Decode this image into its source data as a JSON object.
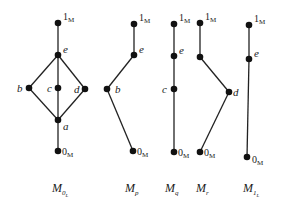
{
  "diagrams": [
    {
      "id": "M0L",
      "caption": "M",
      "caption_sub": "0",
      "caption_subsub": "L",
      "caption_pos": [
        52,
        192
      ],
      "nodes": [
        {
          "id": "1",
          "label": "1",
          "sub": "M",
          "x": 58,
          "y": 23,
          "lx": 63,
          "ly": 20,
          "kind": "bm"
        },
        {
          "id": "e",
          "label": "e",
          "x": 58,
          "y": 55,
          "lx": 63,
          "ly": 53,
          "kind": "lbl"
        },
        {
          "id": "b",
          "label": "b",
          "x": 29,
          "y": 88,
          "lx": 17,
          "ly": 92,
          "kind": "lbl"
        },
        {
          "id": "c",
          "label": "c",
          "x": 58,
          "y": 88,
          "lx": 47,
          "ly": 92,
          "kind": "lbl"
        },
        {
          "id": "d",
          "label": "d",
          "x": 85,
          "y": 89,
          "lx": 74,
          "ly": 93,
          "kind": "lbl"
        },
        {
          "id": "a",
          "label": "a",
          "x": 58,
          "y": 120,
          "lx": 63,
          "ly": 130,
          "kind": "lbl"
        },
        {
          "id": "0",
          "label": "0",
          "sub": "M",
          "x": 58,
          "y": 151,
          "lx": 62,
          "ly": 155,
          "kind": "bm"
        }
      ],
      "edges": [
        [
          "1",
          "e"
        ],
        [
          "e",
          "b"
        ],
        [
          "e",
          "c"
        ],
        [
          "e",
          "d"
        ],
        [
          "b",
          "a"
        ],
        [
          "c",
          "a"
        ],
        [
          "d",
          "a"
        ],
        [
          "a",
          "0"
        ]
      ]
    },
    {
      "id": "Mp",
      "caption": "M",
      "caption_sub": "p",
      "caption_pos": [
        125,
        192
      ],
      "nodes": [
        {
          "id": "1",
          "label": "1",
          "sub": "M",
          "x": 134,
          "y": 24,
          "lx": 139,
          "ly": 21,
          "kind": "bm"
        },
        {
          "id": "e",
          "label": "e",
          "x": 134,
          "y": 55,
          "lx": 139,
          "ly": 53,
          "kind": "lbl"
        },
        {
          "id": "b",
          "label": "b",
          "x": 107,
          "y": 89,
          "lx": 115,
          "ly": 93,
          "kind": "lbl"
        },
        {
          "id": "0",
          "label": "0",
          "sub": "M",
          "x": 133,
          "y": 151,
          "lx": 137,
          "ly": 155,
          "kind": "bm"
        }
      ],
      "edges": [
        [
          "1",
          "e"
        ],
        [
          "e",
          "b"
        ],
        [
          "b",
          "0"
        ]
      ]
    },
    {
      "id": "Mq",
      "caption": "M",
      "caption_sub": "q",
      "caption_pos": [
        165,
        192
      ],
      "nodes": [
        {
          "id": "1",
          "label": "1",
          "sub": "M",
          "x": 174,
          "y": 24,
          "lx": 179,
          "ly": 21,
          "kind": "bm"
        },
        {
          "id": "e",
          "label": "e",
          "x": 174,
          "y": 56,
          "lx": 179,
          "ly": 54,
          "kind": "lbl"
        },
        {
          "id": "c",
          "label": "c",
          "x": 174,
          "y": 89,
          "lx": 162,
          "ly": 93,
          "kind": "lbl"
        },
        {
          "id": "0",
          "label": "0",
          "sub": "M",
          "x": 174,
          "y": 152,
          "lx": 178,
          "ly": 156,
          "kind": "bm"
        }
      ],
      "edges": [
        [
          "1",
          "e"
        ],
        [
          "e",
          "c"
        ],
        [
          "c",
          "0"
        ]
      ]
    },
    {
      "id": "Mr",
      "caption": "M",
      "caption_sub": "r",
      "caption_pos": [
        196,
        192
      ],
      "nodes": [
        {
          "id": "1",
          "label": "1",
          "sub": "M",
          "x": 200,
          "y": 23,
          "lx": 205,
          "ly": 20,
          "kind": "bm"
        },
        {
          "id": "e",
          "label": "",
          "x": 200,
          "y": 57,
          "lx": 0,
          "ly": 0,
          "kind": "lbl"
        },
        {
          "id": "d",
          "label": "d",
          "x": 229,
          "y": 92,
          "lx": 233,
          "ly": 96,
          "kind": "lbl"
        },
        {
          "id": "0",
          "label": "0",
          "sub": "M",
          "x": 200,
          "y": 152,
          "lx": 204,
          "ly": 156,
          "kind": "bm"
        }
      ],
      "edges": [
        [
          "1",
          "e"
        ],
        [
          "e",
          "d"
        ],
        [
          "d",
          "0"
        ]
      ]
    },
    {
      "id": "M1L",
      "caption": "M",
      "caption_sub": "1",
      "caption_subsub": "L",
      "caption_pos": [
        243,
        192
      ],
      "nodes": [
        {
          "id": "1",
          "label": "1",
          "sub": "M",
          "x": 249,
          "y": 25,
          "lx": 254,
          "ly": 22,
          "kind": "bm"
        },
        {
          "id": "e",
          "label": "e",
          "x": 249,
          "y": 59,
          "lx": 254,
          "ly": 57,
          "kind": "lbl"
        },
        {
          "id": "0",
          "label": "0",
          "sub": "M",
          "x": 247,
          "y": 157,
          "lx": 252,
          "ly": 163,
          "kind": "bm"
        }
      ],
      "edges": [
        [
          "1",
          "e"
        ],
        [
          "e",
          "0"
        ]
      ]
    }
  ]
}
